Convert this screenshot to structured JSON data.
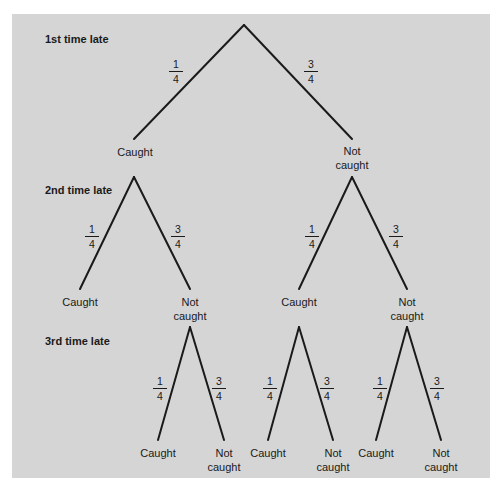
{
  "diagram": {
    "type": "probability-tree",
    "colors": {
      "background": "#d5d5d5",
      "lines": "#1a1a1a",
      "outer": "#ffffff"
    },
    "levels": [
      {
        "label": "1st time late"
      },
      {
        "label": "2nd time late"
      },
      {
        "label": "3rd time late"
      }
    ],
    "outcomes": {
      "caught": "Caught",
      "not_caught_line1": "Not",
      "not_caught_line2": "caught"
    },
    "probabilities": {
      "caught": {
        "numerator": "1",
        "denominator": "4"
      },
      "not_caught": {
        "numerator": "3",
        "denominator": "4"
      }
    },
    "nodes": [
      {
        "id": "root",
        "x": 244,
        "y": 25
      },
      {
        "id": "L1-caught",
        "x": 134,
        "y": 139
      },
      {
        "id": "L1-not",
        "x": 352,
        "y": 139
      },
      {
        "id": "L2-caught-caught",
        "x": 80,
        "y": 289
      },
      {
        "id": "L2-caught-not",
        "x": 190,
        "y": 289
      },
      {
        "id": "L2-not-caught",
        "x": 299,
        "y": 289
      },
      {
        "id": "L2-not-not",
        "x": 407,
        "y": 289
      },
      {
        "id": "L3-a-caught",
        "x": 158,
        "y": 440
      },
      {
        "id": "L3-a-not",
        "x": 224,
        "y": 440
      },
      {
        "id": "L3-b-caught",
        "x": 268,
        "y": 440
      },
      {
        "id": "L3-b-not",
        "x": 333,
        "y": 440
      },
      {
        "id": "L3-c-caught",
        "x": 376,
        "y": 440
      },
      {
        "id": "L3-c-not",
        "x": 441,
        "y": 440
      }
    ]
  }
}
